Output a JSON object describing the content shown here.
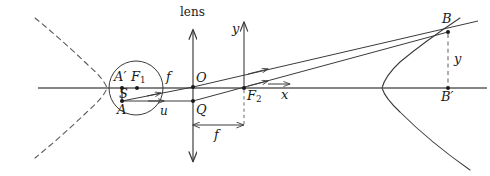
{
  "figure": {
    "background_color": "#ffffff",
    "stroke_color": "#3a3a3a",
    "text_color": "#1a1a1a",
    "width": 490,
    "height": 176
  },
  "labels": {
    "lens": "lens",
    "y_axis": "y",
    "x_axis": "x",
    "origin": "O",
    "point_q": "Q",
    "focus_left": "F",
    "focus_left_sub": "1",
    "focus_right": "F",
    "focus_right_sub": "2",
    "object_top": "A",
    "object_top_prime": "′",
    "object_bottom": "A",
    "source": "S",
    "image_top": "B",
    "image_foot": "B",
    "image_foot_prime": "′",
    "focal_length_upper": "f",
    "focal_length_lower": "f",
    "object_distance": "u",
    "image_height": "y"
  },
  "geometry": {
    "optical_axis_y": 88,
    "lens_x": 193,
    "y_axis_x": 244,
    "origin_point": [
      193,
      87
    ],
    "point_q": [
      193,
      101
    ],
    "focus_left_point": [
      137,
      88
    ],
    "focus_right_point": [
      244,
      88
    ],
    "object_top_point": [
      122,
      88
    ],
    "object_bottom_point": [
      122,
      101
    ],
    "image_point": [
      448,
      32
    ],
    "image_foot_point": [
      448,
      88
    ],
    "circle_center": [
      136,
      88
    ],
    "circle_radius": 27,
    "left_parabola_vertex": [
      107,
      88
    ],
    "right_parabola_vertex": [
      382,
      88
    ],
    "focal_dimension_y": 125,
    "focal_dimension_x1": 193,
    "focal_dimension_x2": 244
  },
  "elements": {
    "left_curve_style": "dashed",
    "right_curve_style": "solid",
    "ray_count": 2,
    "ray_arrow_marker": "open-arrow"
  }
}
